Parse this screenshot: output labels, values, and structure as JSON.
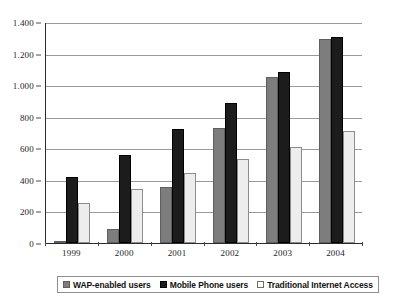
{
  "chart_data": {
    "type": "bar",
    "title": "",
    "xlabel": "",
    "ylabel": "",
    "categories": [
      "1999",
      "2000",
      "2001",
      "2002",
      "2003",
      "2004"
    ],
    "series": [
      {
        "name": "WAP-enabled users",
        "color": "#7d7d7d",
        "values": [
          10,
          90,
          355,
          730,
          1050,
          1290
        ]
      },
      {
        "name": "Mobile Phone users",
        "color": "#1c1c1c",
        "values": [
          420,
          555,
          720,
          885,
          1085,
          1305
        ]
      },
      {
        "name": "Traditional Internet Access",
        "color": "#ededed",
        "values": [
          255,
          340,
          445,
          535,
          610,
          710
        ]
      }
    ],
    "ylim": [
      0,
      1400
    ],
    "yticks": [
      0,
      200,
      400,
      600,
      800,
      1000,
      1200,
      1400
    ],
    "ytick_labels": [
      "0",
      "200",
      "400",
      "600",
      "800",
      "1.000",
      "1.200",
      "1.400"
    ],
    "grid": true,
    "legend_position": "bottom"
  }
}
